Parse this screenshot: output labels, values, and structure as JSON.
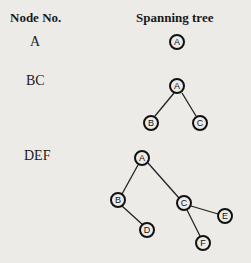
{
  "headers": {
    "node_no": "Node No.",
    "spanning_tree": "Spanning tree"
  },
  "rows": [
    {
      "label": "A",
      "nodes": [
        {
          "id": "A"
        }
      ]
    },
    {
      "label": "BC",
      "nodes": [
        {
          "id": "A"
        },
        {
          "id": "B"
        },
        {
          "id": "C"
        }
      ]
    },
    {
      "label": "DEF",
      "nodes": [
        {
          "id": "A"
        },
        {
          "id": "B"
        },
        {
          "id": "C"
        },
        {
          "id": "D"
        },
        {
          "id": "E"
        },
        {
          "id": "F"
        }
      ]
    }
  ]
}
